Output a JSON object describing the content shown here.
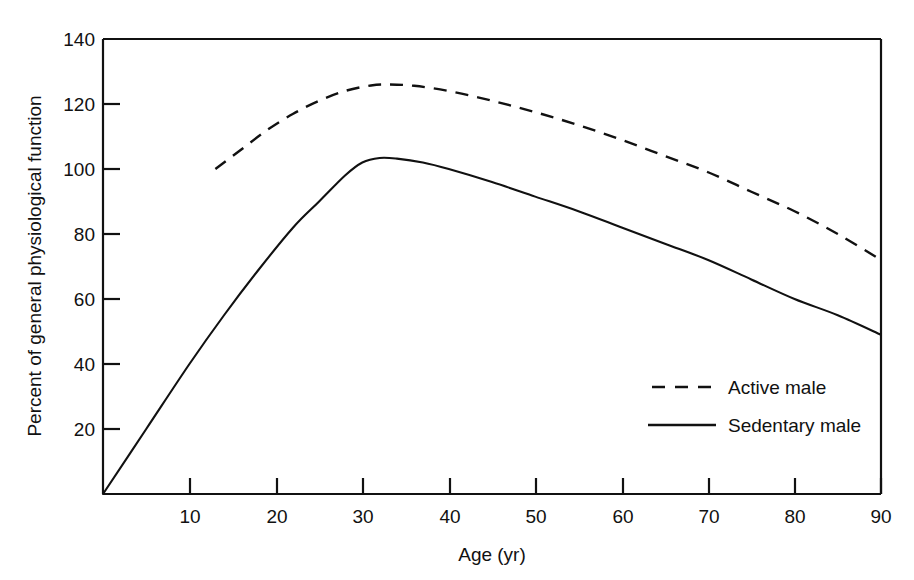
{
  "chart_data": {
    "type": "line",
    "title": "",
    "xlabel": "Age (yr)",
    "ylabel": "Percent of general physiological function",
    "xlim": [
      0,
      90
    ],
    "ylim": [
      0,
      140
    ],
    "xticks": [
      10,
      20,
      30,
      40,
      50,
      60,
      70,
      80,
      90
    ],
    "yticks": [
      20,
      40,
      60,
      80,
      100,
      120,
      140
    ],
    "xtick_labels": [
      "10",
      "20",
      "30",
      "40",
      "50",
      "60",
      "70",
      "80",
      "90"
    ],
    "ytick_labels": [
      "20",
      "40",
      "60",
      "80",
      "100",
      "120",
      "140"
    ],
    "grid": false,
    "legend_position": "inside-lower-right",
    "series": [
      {
        "name": "Active male",
        "style": "dashed",
        "color": "#111111",
        "x": [
          13,
          16,
          19,
          22,
          25,
          28,
          31,
          33,
          36,
          40,
          45,
          50,
          55,
          60,
          65,
          70,
          75,
          80,
          85,
          90
        ],
        "y": [
          100,
          106,
          112,
          117,
          121,
          124,
          125.7,
          126,
          125.6,
          124,
          121,
          117.5,
          113.5,
          109,
          104,
          99,
          93,
          87,
          80,
          72
        ]
      },
      {
        "name": "Sedentary male",
        "style": "solid",
        "color": "#111111",
        "x": [
          0,
          5,
          10,
          14,
          18,
          22,
          25,
          28,
          30,
          32,
          34,
          37,
          40,
          45,
          50,
          55,
          60,
          65,
          70,
          75,
          80,
          85,
          90
        ],
        "y": [
          0,
          20,
          40,
          55,
          69,
          82,
          90,
          98,
          102,
          103.4,
          103.2,
          102,
          100,
          96,
          91.5,
          87,
          82,
          77,
          72,
          66,
          60,
          55,
          49
        ]
      }
    ]
  },
  "axes": {
    "x_axis_label": "Age (yr)",
    "y_axis_label": "Percent of general physiological function"
  },
  "legend": {
    "entries": [
      {
        "label": "Active male",
        "style": "dashed"
      },
      {
        "label": "Sedentary male",
        "style": "solid"
      }
    ]
  },
  "ticks": {
    "x": [
      "10",
      "20",
      "30",
      "40",
      "50",
      "60",
      "70",
      "80",
      "90"
    ],
    "y": [
      "20",
      "40",
      "60",
      "80",
      "100",
      "120",
      "140"
    ]
  }
}
